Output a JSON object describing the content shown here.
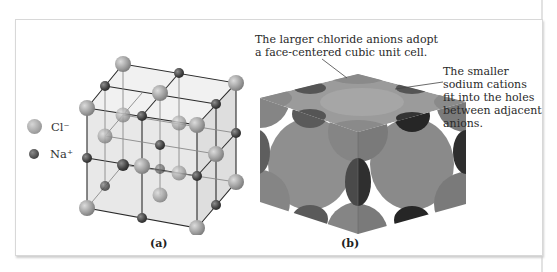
{
  "figure": {
    "legend": [
      {
        "symbol": "chloride-sphere",
        "label": "Cl⁻"
      },
      {
        "symbol": "sodium-sphere",
        "label": "Na⁺"
      }
    ],
    "panel_a": {
      "label": "(a)"
    },
    "panel_b": {
      "label": "(b)"
    },
    "callouts": {
      "anions": {
        "line1": "The larger chloride anions adopt",
        "line2": "a face-centered cubic unit cell."
      },
      "cations": {
        "line1": "The smaller",
        "line2": "sodium cations",
        "line3": "fit into the holes",
        "line4": "between adjacent",
        "line5": "anions."
      }
    },
    "colors": {
      "chloride": "#a3a3a3",
      "sodium": "#4a4a4a",
      "cube_face": "#d9d9d9",
      "lattice_line": "#2a2a2a"
    }
  }
}
